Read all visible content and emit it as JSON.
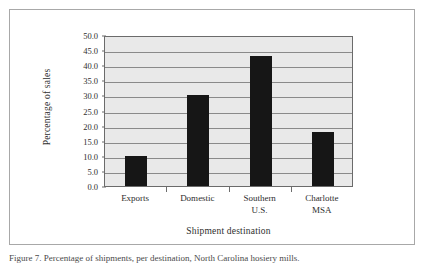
{
  "figure": {
    "caption": "Figure 7. Percentage of shipments, per destination, North Carolina hosiery mills."
  },
  "chart_data": {
    "type": "bar",
    "title": "",
    "xlabel": "Shipment destination",
    "ylabel": "Percentage of sales",
    "categories": [
      "Exports",
      "Domestic",
      "Southern U.S.",
      "Charlotte MSA"
    ],
    "category_lines": [
      [
        "Exports"
      ],
      [
        "Domestic"
      ],
      [
        "Southern",
        "U.S."
      ],
      [
        "Charlotte",
        "MSA"
      ]
    ],
    "values": [
      10.0,
      30.0,
      43.0,
      18.0
    ],
    "ylim": [
      0.0,
      50.0
    ],
    "ytick_step": 5.0,
    "yticks": [
      "50.0",
      "45.0",
      "40.0",
      "35.0",
      "30.0",
      "25.0",
      "20.0",
      "15.0",
      "10.0",
      "5.0",
      "0.0"
    ],
    "ytick_values": [
      50.0,
      45.0,
      40.0,
      35.0,
      30.0,
      25.0,
      20.0,
      15.0,
      10.0,
      5.0,
      0.0
    ],
    "grid": true,
    "legend": false,
    "colors": {
      "bar": "#161616",
      "plot_background": "#e9e9e9",
      "gridline": "#8a8a8a",
      "axis": "#6b6b6b",
      "text": "#2e2e2e",
      "frame": "#a8a8a8"
    }
  }
}
